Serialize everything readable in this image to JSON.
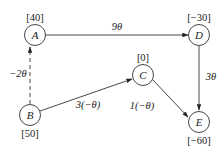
{
  "diagram": {
    "type": "directed-network",
    "nodes": [
      {
        "id": "A",
        "label": "A",
        "supply": "[40]",
        "x": 35,
        "y": 35
      },
      {
        "id": "B",
        "label": "B",
        "supply": "[50]",
        "x": 30,
        "y": 115
      },
      {
        "id": "C",
        "label": "C",
        "supply": "[0]",
        "x": 143,
        "y": 75
      },
      {
        "id": "D",
        "label": "D",
        "supply": "[−30]",
        "x": 199,
        "y": 35
      },
      {
        "id": "E",
        "label": "E",
        "supply": "[−60]",
        "x": 199,
        "y": 122
      }
    ],
    "edges": [
      {
        "from": "A",
        "to": "D",
        "label": "9θ",
        "style": "solid"
      },
      {
        "from": "B",
        "to": "A",
        "label": "−2θ",
        "style": "dashed"
      },
      {
        "from": "B",
        "to": "C",
        "label": "3(−θ)",
        "style": "solid"
      },
      {
        "from": "C",
        "to": "E",
        "label": "1(−θ)",
        "style": "solid"
      },
      {
        "from": "D",
        "to": "E",
        "label": "3θ",
        "style": "solid"
      }
    ]
  }
}
